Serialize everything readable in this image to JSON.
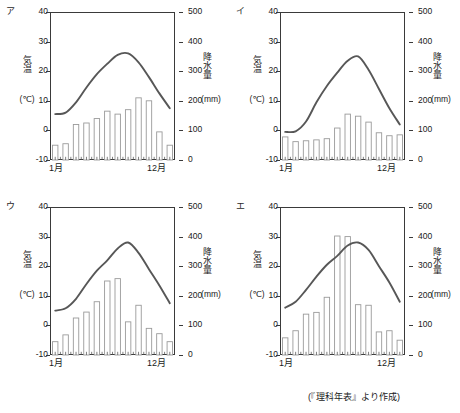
{
  "source_note": "(『理科年表』より作成)",
  "axes": {
    "left_title": "気温",
    "left_unit": "(℃)",
    "right_title": "降水量",
    "right_unit": "(mm)",
    "left_ticks": [
      "40",
      "30",
      "20",
      "10",
      "0",
      "-10"
    ],
    "right_ticks": [
      "500",
      "400",
      "300",
      "200",
      "100",
      "0"
    ],
    "x_first": "1月",
    "x_last": "12月",
    "temp_min": -10,
    "temp_max": 40,
    "precip_min": 0,
    "precip_max": 500
  },
  "chart_data": [
    {
      "type": "line",
      "label": "ア",
      "title": "ア",
      "xlabel": "月",
      "ylabel": "気温 (℃)",
      "y2label": "降水量 (mm)",
      "ylim": [
        -10,
        40
      ],
      "y2lim": [
        0,
        500
      ],
      "grid": false,
      "categories": [
        "1",
        "2",
        "3",
        "4",
        "5",
        "6",
        "7",
        "8",
        "9",
        "10",
        "11",
        "12"
      ],
      "series": [
        {
          "name": "気温",
          "unit": "℃",
          "axis": "left",
          "type": "line",
          "values": [
            5.5,
            6.0,
            9.5,
            14.5,
            19.0,
            22.5,
            25.5,
            26.0,
            23.0,
            18.0,
            12.5,
            7.5
          ]
        },
        {
          "name": "降水量",
          "unit": "mm",
          "axis": "right",
          "type": "bar",
          "values": [
            50,
            55,
            120,
            125,
            140,
            165,
            155,
            170,
            210,
            200,
            95,
            50
          ]
        }
      ]
    },
    {
      "type": "line",
      "label": "イ",
      "title": "イ",
      "xlabel": "月",
      "ylabel": "気温 (℃)",
      "y2label": "降水量 (mm)",
      "ylim": [
        -10,
        40
      ],
      "y2lim": [
        0,
        500
      ],
      "grid": false,
      "categories": [
        "1",
        "2",
        "3",
        "4",
        "5",
        "6",
        "7",
        "8",
        "9",
        "10",
        "11",
        "12"
      ],
      "series": [
        {
          "name": "気温",
          "unit": "℃",
          "axis": "left",
          "type": "line",
          "values": [
            -0.5,
            -0.3,
            3.0,
            9.5,
            15.0,
            19.5,
            23.5,
            25.0,
            20.5,
            14.0,
            7.5,
            2.0
          ]
        },
        {
          "name": "降水量",
          "unit": "mm",
          "axis": "right",
          "type": "bar",
          "values": [
            78,
            62,
            65,
            68,
            72,
            108,
            155,
            148,
            128,
            92,
            82,
            85
          ]
        }
      ]
    },
    {
      "type": "line",
      "label": "ウ",
      "title": "ウ",
      "xlabel": "月",
      "ylabel": "気温 (℃)",
      "y2label": "降水量 (mm)",
      "ylim": [
        -10,
        40
      ],
      "y2lim": [
        0,
        500
      ],
      "grid": false,
      "categories": [
        "1",
        "2",
        "3",
        "4",
        "5",
        "6",
        "7",
        "8",
        "9",
        "10",
        "11",
        "12"
      ],
      "series": [
        {
          "name": "気温",
          "unit": "℃",
          "axis": "left",
          "type": "line",
          "values": [
            5.0,
            5.8,
            9.0,
            14.0,
            18.5,
            22.0,
            26.0,
            28.0,
            24.5,
            19.0,
            13.5,
            7.5
          ]
        },
        {
          "name": "降水量",
          "unit": "mm",
          "axis": "right",
          "type": "bar",
          "values": [
            45,
            68,
            125,
            145,
            180,
            250,
            258,
            112,
            168,
            90,
            72,
            45
          ]
        }
      ]
    },
    {
      "type": "line",
      "label": "エ",
      "title": "エ",
      "xlabel": "月",
      "ylabel": "気温 (℃)",
      "y2label": "降水量 (mm)",
      "ylim": [
        -10,
        40
      ],
      "y2lim": [
        0,
        500
      ],
      "grid": false,
      "categories": [
        "1",
        "2",
        "3",
        "4",
        "5",
        "6",
        "7",
        "8",
        "9",
        "10",
        "11",
        "12"
      ],
      "series": [
        {
          "name": "気温",
          "unit": "℃",
          "axis": "left",
          "type": "line",
          "values": [
            6.0,
            8.0,
            12.0,
            16.5,
            20.5,
            23.5,
            27.0,
            28.0,
            25.5,
            20.0,
            14.5,
            8.0
          ]
        },
        {
          "name": "降水量",
          "unit": "mm",
          "axis": "right",
          "type": "bar",
          "values": [
            58,
            82,
            138,
            144,
            195,
            402,
            400,
            170,
            168,
            78,
            82,
            50
          ]
        }
      ]
    }
  ]
}
